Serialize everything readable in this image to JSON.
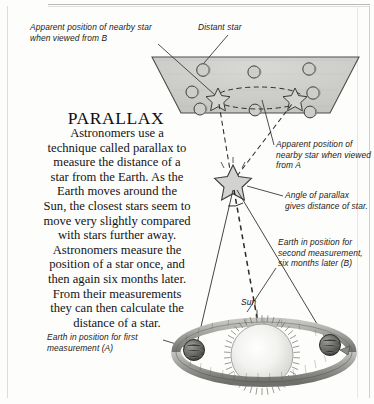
{
  "page": {
    "title": "PARALLAX",
    "body": "Astronomers use a\ntechnique called parallax to\nmeasure the distance of a\nstar from the Earth. As the\nEarth moves around the\nSun, the closest stars seem to\nmove very slightly compared\nwith stars further away.\nAstronomers measure the\nposition of a star once, and\nthen again six months later.\nFrom their measurements\nthey can then calculate the\ndistance of a star."
  },
  "callouts": {
    "apparent_b": "Apparent position of nearby star when viewed from B",
    "distant_star": "Distant star",
    "apparent_a": "Apparent position of nearby star when viewed from A",
    "angle": "Angle of parallax gives distance of star.",
    "earth_second": "Earth in position for second measurement, six months later (B)",
    "earth_first": "Earth in position for first measurement (A)",
    "sun": "Sun"
  },
  "colors": {
    "ink": "#141414",
    "sky_plane_fill": "#cfcfcb",
    "sky_plane_stroke": "#4a4a4a",
    "star_fill": "#d2d2d0",
    "orbit_ring": "#9a9a96",
    "sun_core": "#f4f4f2",
    "earth_body": "#6e6e6a",
    "leader_line": "#3a3a3a",
    "frame": "#cfcfcf"
  },
  "diagram": {
    "type": "stellar-parallax-schematic",
    "sky_plane": {
      "label": "distant star field (trapezoid)",
      "distant_stars": 8,
      "apparent_positions": 2,
      "dashed_ellipse": true
    },
    "nearby_star": {
      "x": 233,
      "y": 182
    },
    "sun": {
      "x": 262,
      "y": 355
    },
    "earth_positions": [
      {
        "id": "A",
        "x": 196,
        "y": 352
      },
      {
        "id": "B",
        "x": 330,
        "y": 347
      }
    ],
    "sight_lines": 2,
    "centerline": "dashed vertical",
    "parallax_angle_arc": true
  }
}
